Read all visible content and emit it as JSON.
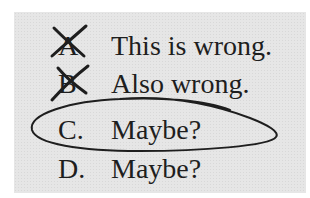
{
  "options": [
    {
      "letter": "A",
      "text": "This is wrong.",
      "mark": "crossed-out"
    },
    {
      "letter": "B",
      "text": "Also wrong.",
      "mark": "crossed-out"
    },
    {
      "letter": "C.",
      "text": "Maybe?",
      "mark": "circled"
    },
    {
      "letter": "D.",
      "text": "Maybe?",
      "mark": "none"
    }
  ],
  "colors": {
    "background": "#e6e6e6",
    "ink": "#1e1e1e"
  }
}
